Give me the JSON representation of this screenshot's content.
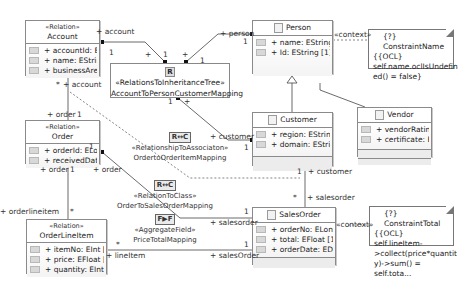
{
  "classes": {
    "account": {
      "stereotype": "«Relation»",
      "name": "Account",
      "attributes": [
        "+ accountId: E...",
        "+ name: EStrin...",
        "+ businessArea..."
      ]
    },
    "person": {
      "name": "Person",
      "attributes": [
        "+ name: EString [1]",
        "+ Id: EString [1]"
      ]
    },
    "customer": {
      "name": "Customer",
      "attributes": [
        "+ region: EString [1]",
        "+ domain: EString..."
      ]
    },
    "vendor": {
      "name": "Vendor",
      "attributes": [
        "+ vendorRating...",
        "+ certificate: E..."
      ]
    },
    "order": {
      "stereotype": "«Relation»",
      "name": "Order",
      "attributes": [
        "+ orderId: ELo...",
        "+ receivedDate..."
      ]
    },
    "orderlineitem": {
      "stereotype": "«Relation»",
      "name": "OrderLineItem",
      "attributes": [
        "+ itemNo: EInt [1]",
        "+ price: EFloat [1]",
        "+ quantity: EInt [1]"
      ]
    },
    "salesorder": {
      "name": "SalesOrder",
      "attributes": [
        "+ orderNo: ELong ...",
        "+ total: EFloat [1]",
        "+ orderDate: EDat..."
      ]
    }
  },
  "notes": {
    "constraint_name": {
      "title": "{?} ConstraintName",
      "body": [
        "{{OCL}",
        "self.name.oclIsUndefin",
        "ed() = false}"
      ]
    },
    "constraint_total": {
      "title": "{?} ConstraintTotal",
      "body": [
        "{{OCL} self.lineItem-",
        ">collect(price*quantit",
        "y)->sum() = self.tota..."
      ]
    }
  },
  "mappings": {
    "inheritance": {
      "badge": "R",
      "stereotype": "«RelationsToInheritanceTree»",
      "name": "AccountToPersonCustomerMapping"
    },
    "assoc": {
      "badge": "R↔C",
      "stereotype": "«RelationshipToAssociaton»",
      "name": "OrdertoOrderItemMapping"
    },
    "toclass": {
      "badge": "R↔C",
      "stereotype": "«RelationToClass»",
      "name": "OrderToSalesOrderMapping"
    },
    "aggregate": {
      "badge": "F▶F",
      "stereotype": "«AggregateField»",
      "name": "PriceTotalMapping"
    }
  },
  "labels": {
    "context": "«context»",
    "plus": "+",
    "one": "1",
    "star": "*",
    "account": "+ account",
    "person": "+ person",
    "order": "+ order",
    "customer": "+ customer",
    "salesorder": "+ salesorder",
    "orderlineitem": "+ orderlineitem",
    "lineitem": "+ lineItem",
    "salesOrder": "+ salesOrder"
  }
}
